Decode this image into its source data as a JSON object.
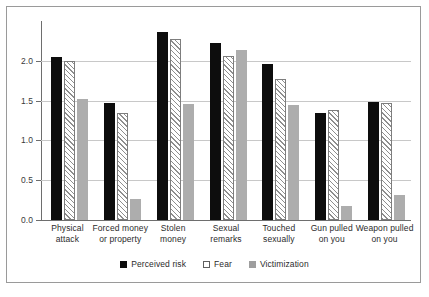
{
  "chart_data": {
    "type": "bar",
    "title": "",
    "subtitle": "",
    "xlabel": "",
    "ylabel": "",
    "ylim": [
      0.0,
      2.5
    ],
    "yticks": [
      0.0,
      0.5,
      1.0,
      1.5,
      2.0
    ],
    "ytick_labels": [
      "0.0",
      "0.5",
      "1.0",
      "1.5",
      "2.0"
    ],
    "grid": true,
    "legend_position": "bottom",
    "categories": [
      "Physical attack",
      "Forced money or property",
      "Stolen money",
      "Sexual remarks",
      "Touched sexually",
      "Gun pulled on you",
      "Weapon pulled on you"
    ],
    "category_lines": [
      [
        "Physical",
        "attack"
      ],
      [
        "Forced money",
        "or property"
      ],
      [
        "Stolen",
        "money"
      ],
      [
        "Sexual",
        "remarks"
      ],
      [
        "Touched",
        "sexually"
      ],
      [
        "Gun pulled",
        "on you"
      ],
      [
        "Weapon pulled",
        "on you"
      ]
    ],
    "series": [
      {
        "name": "Perceived risk",
        "color": "#0d0d0d",
        "pattern": "solid-black",
        "values": [
          2.05,
          1.47,
          2.36,
          2.22,
          1.96,
          1.35,
          1.48
        ]
      },
      {
        "name": "Fear",
        "color": "#ffffff",
        "pattern": "diagonal-hatch",
        "values": [
          2.0,
          1.34,
          2.28,
          2.06,
          1.77,
          1.38,
          1.47
        ]
      },
      {
        "name": "Victimization",
        "color": "#adadad",
        "pattern": "solid-gray",
        "values": [
          1.52,
          0.26,
          1.46,
          2.14,
          1.45,
          0.17,
          0.32
        ]
      }
    ]
  },
  "legend": {
    "items": [
      {
        "label": "Perceived risk"
      },
      {
        "label": "Fear"
      },
      {
        "label": "Victimization"
      }
    ]
  }
}
